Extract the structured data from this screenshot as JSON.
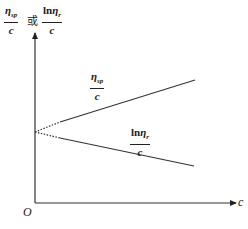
{
  "y_axis_label": {
    "option1": {
      "numerator_symbol": "η",
      "numerator_sub": "sp",
      "denominator": "c"
    },
    "connector": "或",
    "option2": {
      "numerator_prefix": "ln",
      "numerator_symbol": "η",
      "numerator_sub": "r",
      "denominator": "c"
    }
  },
  "x_axis_label": "c",
  "origin_label": "O",
  "lines": [
    {
      "name": "eta_sp_over_c",
      "label": {
        "numerator_symbol": "η",
        "numerator_sub": "sp",
        "denominator": "c"
      },
      "trend": "increasing"
    },
    {
      "name": "ln_eta_r_over_c",
      "label": {
        "numerator_prefix": "ln",
        "numerator_symbol": "η",
        "numerator_sub": "r",
        "denominator": "c"
      },
      "trend": "decreasing"
    }
  ],
  "colors": {
    "line": "#333333",
    "background": "#ffffff"
  }
}
